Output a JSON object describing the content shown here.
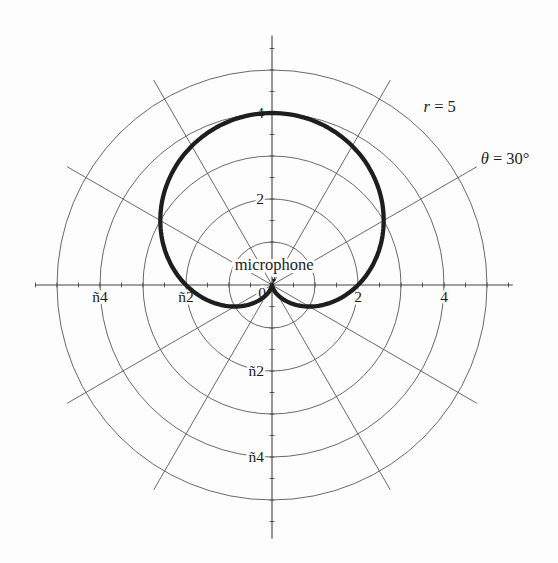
{
  "figure": {
    "background": "#fdfdfd",
    "grid_color": "#585858",
    "axis_color": "#454545",
    "curve_color": "#1e1e1e",
    "text_color": "#1c1c1c"
  },
  "chart_data": {
    "type": "line",
    "subtype": "polar-cardioid",
    "title": "",
    "xlabel": "",
    "ylabel": "",
    "curve": {
      "name": "cardioid-pickup-pattern",
      "equation_r_of_theta": "r = 2 + 2 sin(theta)",
      "a": 2,
      "b": 2,
      "theta_deg_range": [
        0,
        360
      ],
      "max_r": 4,
      "x_axis_crossings": [
        -2,
        2
      ],
      "cusp_at_origin_deg": 270
    },
    "polar_grid": {
      "circle_radii": [
        1,
        2,
        3,
        4,
        5
      ],
      "radial_lines_deg": [
        30,
        60,
        120,
        150
      ],
      "radial_line_extent": 5.5,
      "tick_step": 0.5,
      "tick_extent": 5.5
    },
    "axes": {
      "x_range": [
        -5.5,
        5.6
      ],
      "y_range": [
        -5.9,
        5.8
      ],
      "x_tick_labels": [
        {
          "value": -4,
          "label": "ñ4"
        },
        {
          "value": -2,
          "label": "ñ2"
        },
        {
          "value": 2,
          "label": "2"
        },
        {
          "value": 4,
          "label": "4"
        }
      ],
      "y_tick_labels": [
        {
          "value": 4,
          "label": "4"
        },
        {
          "value": 2,
          "label": "2"
        },
        {
          "value": -2,
          "label": "ñ2"
        },
        {
          "value": -4,
          "label": "ñ4"
        }
      ],
      "origin_label": "0"
    },
    "annotations": [
      {
        "name": "outer-radius-label",
        "ux": 3.9,
        "uy": 4.15,
        "parts": [
          {
            "text": "r",
            "italic": true
          },
          {
            "text": " = 5",
            "italic": false
          }
        ]
      },
      {
        "name": "angle-label",
        "ux": 5.42,
        "uy": 2.93,
        "parts": [
          {
            "text": "θ",
            "italic": true
          },
          {
            "text": " = 30°",
            "italic": false
          }
        ]
      },
      {
        "name": "microphone-label",
        "ux": 0.05,
        "uy": 0.47,
        "parts": [
          {
            "text": "microphone",
            "italic": false
          }
        ],
        "arrow": {
          "from": [
            0.1,
            0.28
          ],
          "to": [
            0.02,
            0.05
          ]
        }
      }
    ]
  }
}
